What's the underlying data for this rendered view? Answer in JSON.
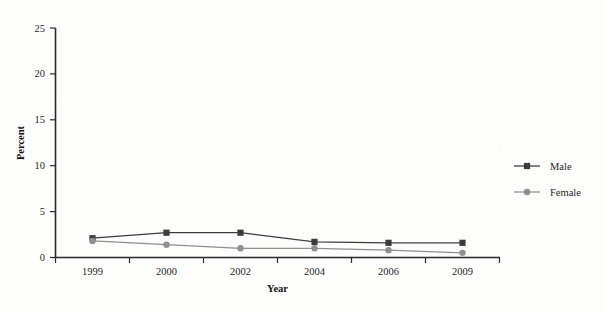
{
  "chart_data": {
    "type": "line",
    "title": "",
    "subtitle": "",
    "xlabel": "Year",
    "ylabel": "Percent",
    "categories": [
      "1999",
      "2000",
      "2002",
      "2004",
      "2006",
      "2009"
    ],
    "ylim": [
      0,
      25
    ],
    "yticks": [
      "0",
      "5",
      "10",
      "15",
      "20",
      "25"
    ],
    "grid": false,
    "legend_position": "right",
    "series": [
      {
        "name": "Male",
        "color": "#3c3c3c",
        "marker": "square",
        "values": [
          2.1,
          2.7,
          2.7,
          1.7,
          1.6,
          1.6
        ]
      },
      {
        "name": "Female",
        "color": "#8f8f8f",
        "marker": "circle",
        "values": [
          1.8,
          1.4,
          1.0,
          1.0,
          0.8,
          0.5
        ]
      }
    ]
  },
  "axes": {
    "y_title": "Percent",
    "x_title": "Year",
    "y_ticks": [
      "0",
      "5",
      "10",
      "15",
      "20",
      "25"
    ],
    "x_ticks": [
      "1999",
      "2000",
      "2002",
      "2004",
      "2006",
      "2009"
    ]
  },
  "legend": {
    "entries": [
      {
        "label": "Male",
        "color": "#3c3c3c",
        "marker": "square"
      },
      {
        "label": "Female",
        "color": "#8f8f8f",
        "marker": "circle"
      }
    ]
  },
  "colors": {
    "male": "#3c3c3c",
    "female": "#8f8f8f",
    "axis": "#2a2a2a",
    "background": "#fdfdfc"
  }
}
